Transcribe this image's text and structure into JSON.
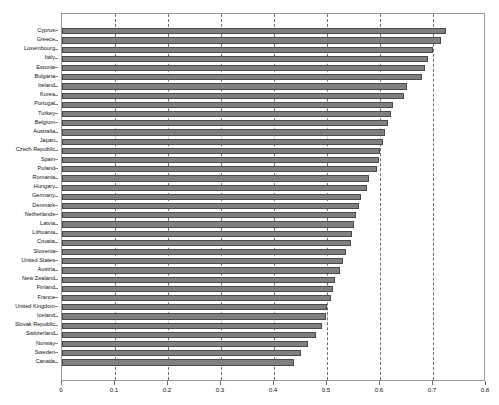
{
  "chart_data": {
    "type": "bar",
    "orientation": "horizontal",
    "title": "",
    "subtitle": "",
    "xlabel": "",
    "ylabel": "",
    "xlim": [
      0,
      0.8
    ],
    "ylim": null,
    "grid": true,
    "grid_axis": "x",
    "grid_style": "dashed",
    "legend": false,
    "legend_position": "none",
    "bar_color": "#808080",
    "bar_edge_color": "#4a4a4a",
    "axis_color": "#9a9a9a",
    "background_color": "#ffffff",
    "xticks": [
      0,
      0.1,
      0.2,
      0.3,
      0.4,
      0.5,
      0.6,
      0.7,
      0.8
    ],
    "xtick_labels": [
      "0",
      "0.1",
      "0.2",
      "0.3",
      "0.4",
      "0.5",
      "0.6",
      "0.7",
      "0.8"
    ],
    "categories": [
      "Cyprus",
      "Greece",
      "Luxembourg",
      "Italy",
      "Estonia",
      "Bulgaria",
      "Ireland",
      "Korea",
      "Portugal",
      "Turkey",
      "Belgium",
      "Australia",
      "Japan",
      "Czech Republic",
      "Spain",
      "Poland",
      "Romania",
      "Hungary",
      "Germany",
      "Denmark",
      "Netherlands",
      "Latvia",
      "Lithuania",
      "Croatia",
      "Slovenia",
      "United States",
      "Austria",
      "New Zealand",
      "Finland",
      "France",
      "United Kingdom",
      "Iceland",
      "Slovak Republic",
      "Switzerland",
      "Norway",
      "Sweden",
      "Canada"
    ],
    "values": [
      0.725,
      0.715,
      0.7,
      0.69,
      0.685,
      0.68,
      0.65,
      0.645,
      0.625,
      0.62,
      0.615,
      0.61,
      0.605,
      0.6,
      0.598,
      0.595,
      0.58,
      0.575,
      0.565,
      0.56,
      0.555,
      0.55,
      0.548,
      0.545,
      0.535,
      0.53,
      0.525,
      0.515,
      0.512,
      0.508,
      0.5,
      0.498,
      0.49,
      0.48,
      0.465,
      0.45,
      0.438
    ]
  }
}
